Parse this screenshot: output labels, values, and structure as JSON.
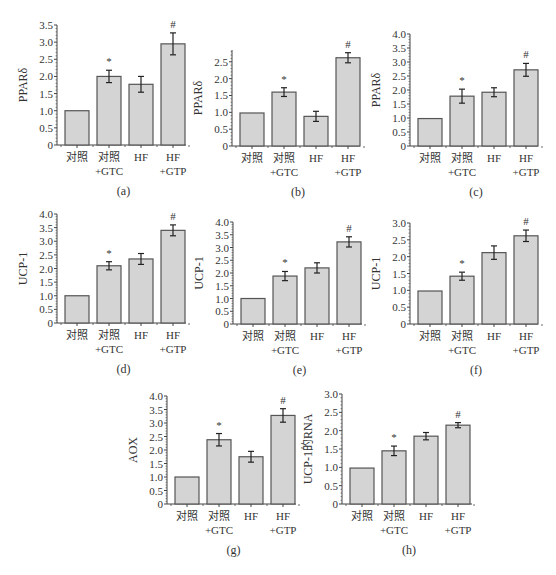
{
  "colors": {
    "bar_fill": "#d4d4d4",
    "bar_stroke": "#555555",
    "axis": "#444444",
    "text": "#333333"
  },
  "categories": [
    {
      "line1": "对照",
      "line2": ""
    },
    {
      "line1": "对照",
      "line2": "+GTC"
    },
    {
      "line1": "HF",
      "line2": ""
    },
    {
      "line1": "HF",
      "line2": "+GTP"
    }
  ],
  "chart_data": [
    {
      "id": "a",
      "type": "bar",
      "caption": "(a)",
      "ylabel": "PPARδ",
      "ylim": [
        0,
        3.5
      ],
      "yticks": [
        0,
        0.5,
        1.0,
        1.5,
        2.0,
        2.5,
        3.0,
        3.5
      ],
      "categories": [
        "对照",
        "对照+GTC",
        "HF",
        "HF+GTP"
      ],
      "values": [
        1.0,
        2.0,
        1.77,
        2.95
      ],
      "errors": [
        0,
        0.18,
        0.23,
        0.32
      ],
      "markers": [
        "",
        "*",
        "",
        "#"
      ]
    },
    {
      "id": "b",
      "type": "bar",
      "caption": "(b)",
      "ylabel": "PPARδ",
      "ylim": [
        0,
        2.5
      ],
      "ymax_axis": 2.85,
      "yticks": [
        0,
        0.5,
        1.0,
        1.5,
        2.0,
        2.5
      ],
      "categories": [
        "对照",
        "对照+GTC",
        "HF",
        "HF+GTP"
      ],
      "values": [
        0.98,
        1.6,
        0.88,
        2.62
      ],
      "errors": [
        0,
        0.13,
        0.15,
        0.15
      ],
      "markers": [
        "",
        "*",
        "",
        "#"
      ]
    },
    {
      "id": "c",
      "type": "bar",
      "caption": "(c)",
      "ylabel": "PPARδ",
      "ylim": [
        0,
        4.0
      ],
      "yticks": [
        0,
        0.5,
        1.0,
        1.5,
        2.0,
        2.5,
        3.0,
        3.5,
        4.0
      ],
      "categories": [
        "对照",
        "对照+GTC",
        "HF",
        "HF+GTP"
      ],
      "values": [
        0.98,
        1.78,
        1.92,
        2.72
      ],
      "errors": [
        0,
        0.25,
        0.16,
        0.23
      ],
      "markers": [
        "",
        "*",
        "",
        "#"
      ]
    },
    {
      "id": "d",
      "type": "bar",
      "caption": "(d)",
      "ylabel": "UCP-1",
      "ylim": [
        0,
        4.0
      ],
      "yticks": [
        0,
        0.5,
        1.0,
        1.5,
        2.0,
        2.5,
        3.0,
        3.5,
        4.0
      ],
      "categories": [
        "对照",
        "对照+GTC",
        "HF",
        "HF+GTP"
      ],
      "values": [
        1.0,
        2.1,
        2.35,
        3.4
      ],
      "errors": [
        0,
        0.15,
        0.2,
        0.2
      ],
      "markers": [
        "",
        "*",
        "",
        "#"
      ]
    },
    {
      "id": "e",
      "type": "bar",
      "caption": "(e)",
      "ylabel": "UCP-1",
      "ylim": [
        0,
        4.0
      ],
      "yticks": [
        0,
        0.5,
        1.0,
        1.5,
        2.0,
        2.5,
        3.0,
        3.5,
        4.0
      ],
      "categories": [
        "对照",
        "对照+GTC",
        "HF",
        "HF+GTP"
      ],
      "values": [
        1.0,
        1.88,
        2.2,
        3.22
      ],
      "errors": [
        0,
        0.18,
        0.2,
        0.2
      ],
      "markers": [
        "",
        "*",
        "",
        "#"
      ]
    },
    {
      "id": "f",
      "type": "bar",
      "caption": "(f)",
      "ylabel": "UCP-1",
      "ylim": [
        0,
        3.0
      ],
      "yticks": [
        0,
        0.5,
        1.0,
        1.5,
        2.0,
        2.5,
        3.0
      ],
      "categories": [
        "对照",
        "对照+GTC",
        "HF",
        "HF+GTP"
      ],
      "values": [
        0.98,
        1.42,
        2.12,
        2.62
      ],
      "errors": [
        0,
        0.12,
        0.2,
        0.17
      ],
      "markers": [
        "",
        "*",
        "",
        "#"
      ]
    },
    {
      "id": "g",
      "type": "bar",
      "caption": "(g)",
      "ylabel": "AOX",
      "ylim": [
        0,
        4.0
      ],
      "yticks": [
        0,
        0.5,
        1.0,
        1.5,
        2.0,
        2.5,
        3.0,
        3.5,
        4.0
      ],
      "categories": [
        "对照",
        "对照+GTC",
        "HF",
        "HF+GTP"
      ],
      "values": [
        1.0,
        2.38,
        1.75,
        3.28
      ],
      "errors": [
        0,
        0.23,
        0.2,
        0.25
      ],
      "markers": [
        "",
        "*",
        "",
        "#"
      ]
    },
    {
      "id": "h",
      "type": "bar",
      "caption": "(h)",
      "ylabel": "UCP-1的RNA",
      "ylim": [
        0,
        3.0
      ],
      "yticks": [
        0,
        0.5,
        1.0,
        1.5,
        2.0,
        2.5,
        3.0
      ],
      "categories": [
        "对照",
        "对照+GTC",
        "HF",
        "HF+GTP"
      ],
      "values": [
        0.98,
        1.45,
        1.85,
        2.15
      ],
      "errors": [
        0,
        0.13,
        0.1,
        0.07
      ],
      "markers": [
        "",
        "*",
        "",
        "#"
      ]
    }
  ],
  "layout": [
    {
      "id": "a",
      "left": 0,
      "top": 0,
      "axis_x": 57,
      "y_zero": 145,
      "y_top": 25,
      "bar_x0": 61,
      "bar_step": 32,
      "bar_w": 24,
      "x_end": 186
    },
    {
      "id": "b",
      "left": 0,
      "top": 0,
      "axis_x": 232,
      "y_zero": 146,
      "y_top": 50,
      "bar_x0": 236,
      "bar_step": 32,
      "bar_w": 24,
      "x_end": 360
    },
    {
      "id": "c",
      "left": 0,
      "top": 0,
      "axis_x": 410,
      "y_zero": 146,
      "y_top": 34,
      "bar_x0": 414,
      "bar_step": 32,
      "bar_w": 24,
      "x_end": 538
    },
    {
      "id": "d",
      "left": 0,
      "top": 0,
      "axis_x": 57,
      "y_zero": 323,
      "y_top": 214,
      "bar_x0": 61,
      "bar_step": 32,
      "bar_w": 24,
      "x_end": 186
    },
    {
      "id": "e",
      "left": 0,
      "top": 0,
      "axis_x": 233,
      "y_zero": 324,
      "y_top": 222,
      "bar_x0": 237,
      "bar_step": 32,
      "bar_w": 24,
      "x_end": 362
    },
    {
      "id": "f",
      "left": 0,
      "top": 0,
      "axis_x": 410,
      "y_zero": 324,
      "y_top": 223,
      "bar_x0": 414,
      "bar_step": 32,
      "bar_w": 24,
      "x_end": 538
    },
    {
      "id": "g",
      "left": 0,
      "top": 0,
      "axis_x": 167,
      "y_zero": 504,
      "y_top": 396,
      "bar_x0": 171,
      "bar_step": 32,
      "bar_w": 24,
      "x_end": 296
    },
    {
      "id": "h",
      "left": 0,
      "top": 0,
      "axis_x": 342,
      "y_zero": 504,
      "y_top": 394,
      "bar_x0": 346,
      "bar_step": 32,
      "bar_w": 24,
      "x_end": 472
    }
  ]
}
